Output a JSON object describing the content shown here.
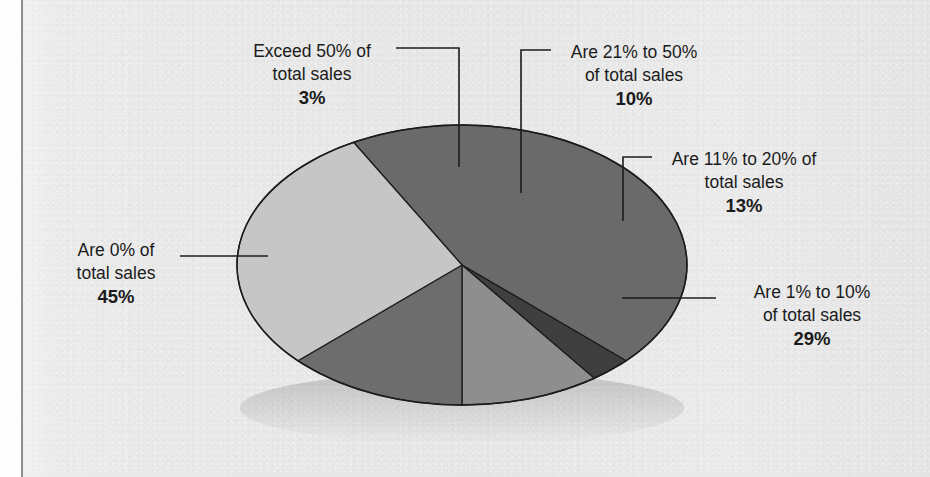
{
  "figure": {
    "type": "pie-3d",
    "background_color": "#e9e9e9",
    "text_color": "#1b1b1b"
  },
  "chart_data": {
    "type": "pie",
    "title": "",
    "subtitle": "",
    "xlabel": "",
    "ylabel": "",
    "grid": false,
    "legend_position": "none",
    "labels_style": "callout-leader-lines",
    "units": "percent",
    "categories": [
      "Are 0% of total sales",
      "Exceed 50% of total sales",
      "Are 21% to 50% of total sales",
      "Are 11% to 20% of total sales",
      "Are 1% to 10% of total sales"
    ],
    "values": [
      45,
      3,
      10,
      13,
      29
    ],
    "slice_colors": [
      "#6a6a6a",
      "#3f3f3f",
      "#8e8e8e",
      "#6d6d6d",
      "#c6c6c6"
    ],
    "slice_side_colors": [
      "#4a4a4a",
      "#2c2c2c",
      "#6e6e6e",
      "#525252",
      "#a3a3a3"
    ],
    "slices": [
      {
        "name": "Are 0% of total sales",
        "value": 45,
        "value_label": "45%",
        "line1": "Are 0% of",
        "line2": "total sales",
        "fill": "#6a6a6a",
        "side": "#4a4a4a"
      },
      {
        "name": "Exceed 50% of total sales",
        "value": 3,
        "value_label": "3%",
        "line1": "Exceed 50% of",
        "line2": "total sales",
        "fill": "#3f3f3f",
        "side": "#2c2c2c"
      },
      {
        "name": "Are 21% to 50% of total sales",
        "value": 10,
        "value_label": "10%",
        "line1": "Are 21% to 50%",
        "line2": "of total sales",
        "fill": "#8e8e8e",
        "side": "#6e6e6e"
      },
      {
        "name": "Are 11% to 20% of total sales",
        "value": 13,
        "value_label": "13%",
        "line1": "Are 11% to 20% of",
        "line2": "total sales",
        "fill": "#6d6d6d",
        "side": "#525252"
      },
      {
        "name": "Are 1% to 10% of total sales",
        "value": 29,
        "value_label": "29%",
        "line1": "Are 1% to 10%",
        "line2": "of total sales",
        "fill": "#c6c6c6",
        "side": "#a3a3a3"
      }
    ],
    "total": 100
  },
  "labels": {
    "exceed50": {
      "line1": "Exceed 50% of",
      "line2": "total sales",
      "pct": "3%"
    },
    "range21to50": {
      "line1": "Are 21% to 50%",
      "line2": "of total sales",
      "pct": "10%"
    },
    "range11to20": {
      "line1": "Are 11% to 20% of",
      "line2": "total sales",
      "pct": "13%"
    },
    "range1to10": {
      "line1": "Are 1% to 10%",
      "line2": "of total sales",
      "pct": "29%"
    },
    "zero": {
      "line1": "Are 0% of",
      "line2": "total sales",
      "pct": "45%"
    }
  }
}
